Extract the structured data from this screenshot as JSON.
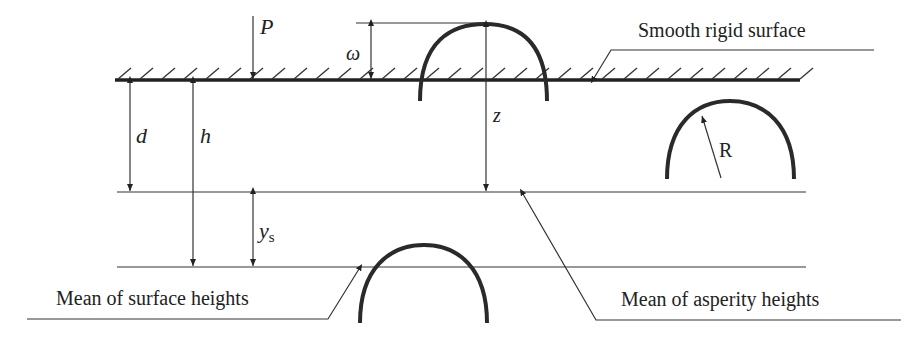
{
  "diagram": {
    "labels": {
      "load": "P",
      "interference": "ω",
      "separation_asperity": "d",
      "separation_surface": "h",
      "asperity_height": "z",
      "offset": "y",
      "offset_subscript": "s",
      "radius": "R"
    },
    "callouts": {
      "rigid_surface": "Smooth rigid surface",
      "surface_mean": "Mean of surface heights",
      "asperity_mean": "Mean of asperity heights"
    },
    "colors": {
      "line": "#222222",
      "background": "#ffffff"
    }
  }
}
